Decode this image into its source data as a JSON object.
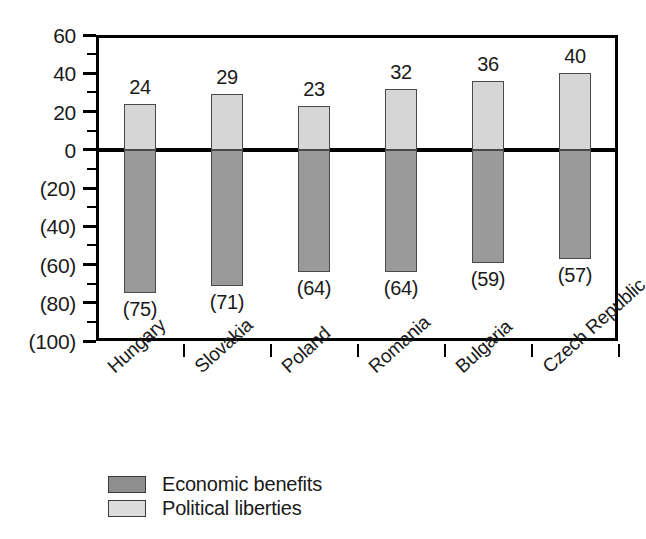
{
  "chart_data": {
    "type": "bar",
    "title": "",
    "subtitle": "",
    "xlabel": "",
    "ylabel": "",
    "categories": [
      "Hungary",
      "Slovakia",
      "Poland",
      "Romania",
      "Bulgaria",
      "Czech Republic"
    ],
    "series": [
      {
        "name": "Economic benefits",
        "color": "#9a9a9a",
        "values": [
          -75,
          -71,
          -64,
          -64,
          -59,
          -57
        ],
        "value_labels": [
          "(75)",
          "(71)",
          "(64)",
          "(64)",
          "(59)",
          "(57)"
        ]
      },
      {
        "name": "Political liberties",
        "color": "#d6d6d6",
        "values": [
          24,
          29,
          23,
          32,
          36,
          40
        ],
        "value_labels": [
          "24",
          "29",
          "23",
          "32",
          "36",
          "40"
        ]
      }
    ],
    "ylim": [
      -100,
      60
    ],
    "y_ticks": [
      60,
      40,
      20,
      0,
      -20,
      -40,
      -60,
      -80,
      -100
    ],
    "y_tick_labels": [
      "60",
      "40",
      "20",
      "0",
      "(20)",
      "(40)",
      "(60)",
      "(80)",
      "(100)"
    ],
    "y_minor_tick_step": 10,
    "grid": false,
    "legend_position": "bottom-left",
    "legend": [
      {
        "label": "Economic benefits",
        "color": "#9a9a9a"
      },
      {
        "label": "Political liberties",
        "color": "#d6d6d6"
      }
    ]
  }
}
